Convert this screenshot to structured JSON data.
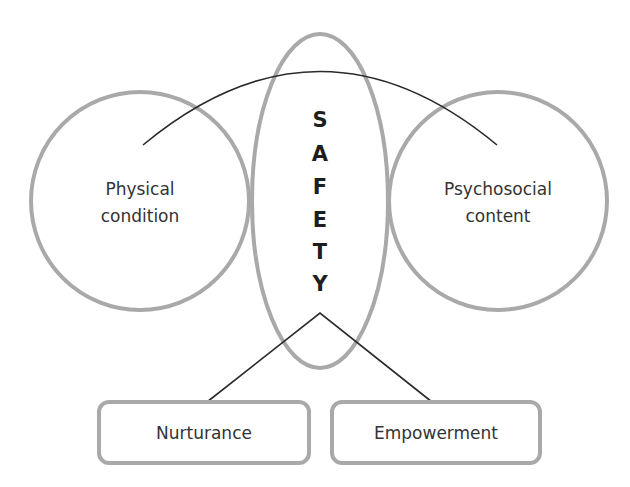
{
  "diagram": {
    "colors": {
      "outline": "#a9a9a9",
      "connector": "#2a2a2a",
      "text": "#333333",
      "safety_text": "#1e1e1e",
      "background": "#ffffff"
    },
    "center": {
      "letters": [
        "S",
        "A",
        "F",
        "E",
        "T",
        "Y"
      ],
      "word": "SAFETY"
    },
    "left_circle": {
      "line1": "Physical",
      "line2": "condition"
    },
    "right_circle": {
      "line1": "Psychosocial",
      "line2": "content"
    },
    "boxes": [
      {
        "label": "Nurturance"
      },
      {
        "label": "Empowerment"
      }
    ]
  }
}
